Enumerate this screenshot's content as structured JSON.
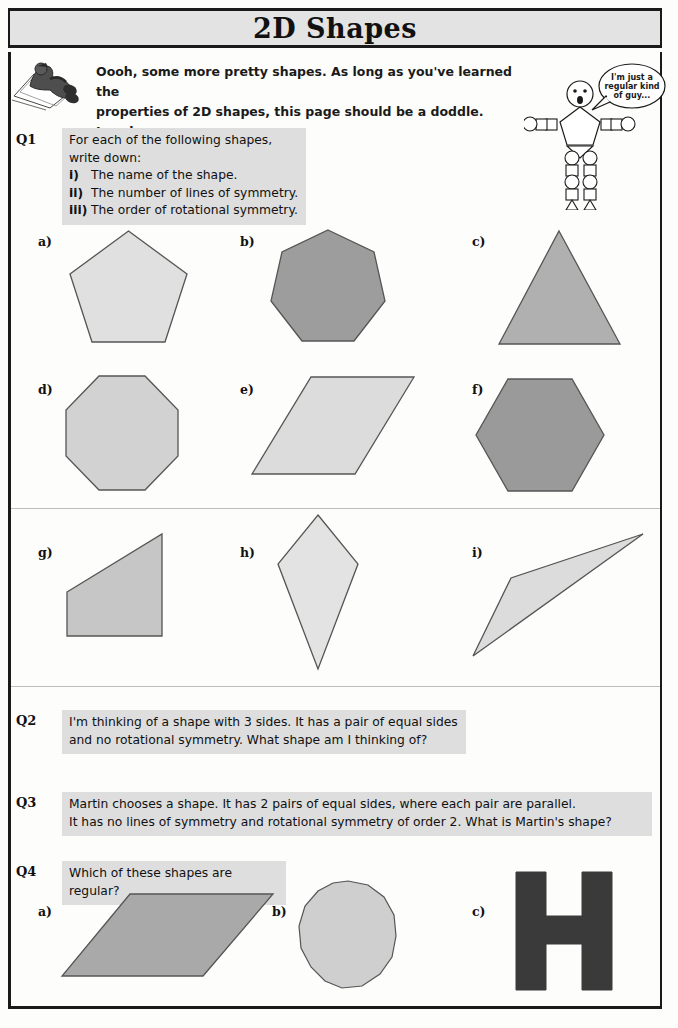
{
  "header": {
    "title": "2D Shapes"
  },
  "intro": {
    "line1": "Oooh, some more pretty shapes.  As long as you've learned the",
    "line2": "properties of 2D shapes, this page should be a doddle.  Lovely.",
    "mascot_left": "reclining-person-on-sun-lounger",
    "mascot_right": "stick-figure-made-of-shapes"
  },
  "speech_bubble": {
    "line1": "I'm just a",
    "line2": "regular kind",
    "line3": "of guy..."
  },
  "questions": [
    {
      "label": "Q1",
      "lead": "For each of the following shapes, write down:",
      "items": [
        {
          "marker": "i)",
          "text": "The name of the shape."
        },
        {
          "marker": "ii)",
          "text": "The number of lines of symmetry."
        },
        {
          "marker": "iii)",
          "text": "The order of rotational symmetry."
        }
      ]
    },
    {
      "label": "Q2",
      "line1": "I'm thinking of a shape with 3 sides.  It has a pair of equal sides",
      "line2": "and no rotational symmetry.  What shape am I thinking of?"
    },
    {
      "label": "Q3",
      "line1": "Martin chooses a shape.  It has 2 pairs of equal sides, where each pair are parallel.",
      "line2": "It has no lines of symmetry and rotational symmetry of order 2.  What is Martin's shape?"
    },
    {
      "label": "Q4",
      "lead": "Which of these shapes are regular?"
    }
  ],
  "q1_shapes": [
    {
      "part": "a)",
      "name": "regular-pentagon",
      "fill": "#e0e0e0",
      "sides": 5
    },
    {
      "part": "b)",
      "name": "regular-heptagon",
      "fill": "#9d9d9d",
      "sides": 7
    },
    {
      "part": "c)",
      "name": "isosceles-triangle",
      "fill": "#b0b0b0",
      "sides": 3
    },
    {
      "part": "d)",
      "name": "regular-octagon",
      "fill": "#d2d2d2",
      "sides": 8
    },
    {
      "part": "e)",
      "name": "parallelogram",
      "fill": "#dcdcdc",
      "sides": 4
    },
    {
      "part": "f)",
      "name": "regular-hexagon",
      "fill": "#9a9a9a",
      "sides": 6
    },
    {
      "part": "g)",
      "name": "right-trapezium",
      "fill": "#c6c6c6",
      "sides": 4
    },
    {
      "part": "h)",
      "name": "kite",
      "fill": "#e3e3e3",
      "sides": 4
    },
    {
      "part": "i)",
      "name": "scalene-triangle",
      "fill": "#dcdcdc",
      "sides": 3
    }
  ],
  "q4_shapes": [
    {
      "part": "a)",
      "name": "flat-parallelogram",
      "fill": "#a9a9a9",
      "sides": 4
    },
    {
      "part": "b)",
      "name": "many-sided-polygon",
      "fill": "#cfcfcf",
      "sides": 14
    },
    {
      "part": "c)",
      "name": "letter-h-shape",
      "fill": "#3a3a3a",
      "sides": 12
    }
  ],
  "colors": {
    "ink": "#1a1a1a",
    "shaded_block": "#dedede",
    "title_bar": "#e3e3e3",
    "rule": "#bdbdbd"
  }
}
